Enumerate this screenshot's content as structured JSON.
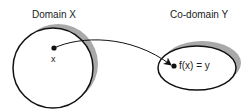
{
  "diagram": {
    "domain": {
      "title": "Domain X",
      "point_label": "x",
      "shape": "circle",
      "center": [
        53,
        68
      ],
      "radius": 40
    },
    "codomain": {
      "title": "Co-domain Y",
      "point_label": "f(x) = y",
      "shape": "ellipse",
      "center": [
        197,
        68
      ],
      "rx": 39,
      "ry": 22
    },
    "mapping": {
      "from": "x",
      "to": "f(x) = y",
      "style": "curved-arrow"
    },
    "colors": {
      "stroke": "#111111",
      "shadow": "#a9a9a9",
      "background": "#ffffff"
    }
  }
}
